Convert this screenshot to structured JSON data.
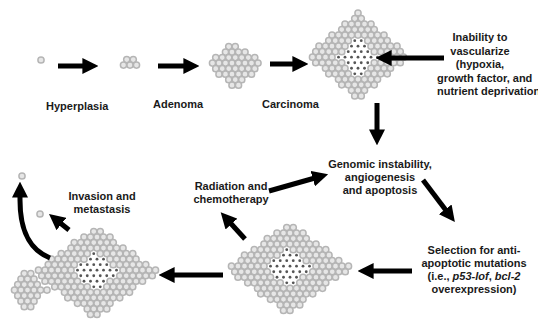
{
  "diagram": {
    "stages": {
      "hyperplasia": "Hyperplasia",
      "adenoma": "Adenoma",
      "carcinoma": "Carcinoma"
    },
    "annotations": {
      "vascularize": [
        "Inability to",
        "vascularize",
        "(hypoxia,",
        "growth factor, and",
        "nutrient deprivation)"
      ],
      "genomic": [
        "Genomic instability,",
        "angiogenesis",
        "and apoptosis"
      ],
      "radiation": [
        "Radiation and",
        "chemotherapy"
      ],
      "selection_line1": "Selection for anti-",
      "selection_line2": "apoptotic mutations",
      "selection_line3_prefix": "(i.e., ",
      "selection_line3_gene1": "p53-lof",
      "selection_line3_sep": ", ",
      "selection_line3_gene2": "bcl-2",
      "selection_line4": "overexpression)",
      "invasion": [
        "Invasion and",
        "metastasis"
      ]
    },
    "colors": {
      "cell_outline": "#b5b5b5",
      "cell_fill": "#e6e6e6",
      "necrotic_dot": "#555555",
      "arrow": "#000000",
      "text": "#1a1a1a"
    }
  }
}
